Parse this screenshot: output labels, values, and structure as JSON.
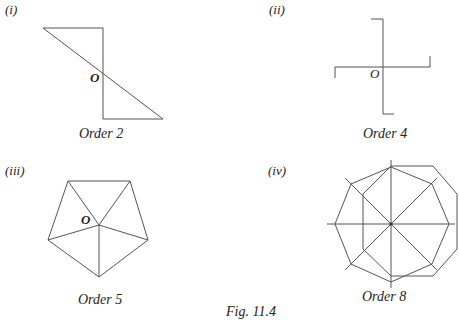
{
  "figure": {
    "caption": "Fig. 11.4",
    "panels": [
      {
        "index": "(i)",
        "centre_label": "O",
        "caption": "Order 2",
        "shape": "two right triangles joined at centre"
      },
      {
        "index": "(ii)",
        "centre_label": "O",
        "caption": "Order 4",
        "shape": "cross with hooked ends"
      },
      {
        "index": "(iii)",
        "centre_label": "O",
        "caption": "Order 5",
        "shape": "regular pentagon with spokes to vertices"
      },
      {
        "index": "(iv)",
        "centre_label": "",
        "caption": "Order 8",
        "shape": "regular octagon with extended diagonals"
      }
    ]
  },
  "colors": {
    "stroke": "#555555",
    "text": "#222222",
    "background": "#ffffff"
  }
}
